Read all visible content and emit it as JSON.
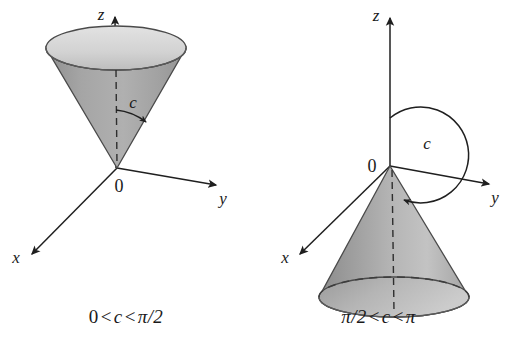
{
  "figure": {
    "background_color": "#ffffff",
    "ink_color": "#1a1a1a",
    "cone_fill_dark": "#9c9c9c",
    "cone_fill_mid": "#b4b4b4",
    "cone_fill_light": "#d9d9d9",
    "cone_inner_fill": "#d2d2d2",
    "stroke_color": "#3b3b3b"
  },
  "panels": [
    {
      "id": "left",
      "caption": {
        "full": "0 < c < π/2",
        "lower_bound": "0",
        "rel_left": "<",
        "variable": "c",
        "rel_right": "<",
        "upper_bound": "π/2"
      },
      "axes": {
        "z_label": "z",
        "y_label": "y",
        "x_label": "x",
        "origin_label": "0"
      },
      "angle": {
        "label": "c",
        "description": "acute angle from positive z-axis to cone surface",
        "degrees_approx": 35
      },
      "cone": {
        "orientation": "opens upward",
        "apex": "at origin",
        "axis": "positive z-axis"
      }
    },
    {
      "id": "right",
      "caption": {
        "full": "π/2 < c < π",
        "lower_bound": "π/2",
        "rel_left": "<",
        "variable": "c",
        "rel_right": "<",
        "upper_bound": "π"
      },
      "axes": {
        "z_label": "z",
        "y_label": "y",
        "x_label": "x",
        "origin_label": "0"
      },
      "angle": {
        "label": "c",
        "description": "obtuse angle from positive z-axis to cone surface",
        "degrees_approx": 130
      },
      "cone": {
        "orientation": "opens downward",
        "apex": "at origin",
        "axis": "negative z-axis"
      }
    }
  ]
}
